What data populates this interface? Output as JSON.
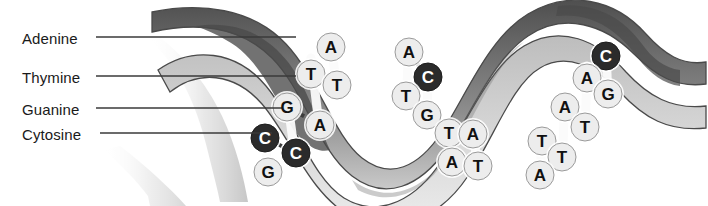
{
  "figure": {
    "width": 708,
    "height": 206,
    "background_color": "#ffffff"
  },
  "colors": {
    "label_text": "#1a1a1a",
    "leader_line": "#3a3a3a",
    "ribbon_outline": "#4a4a4a",
    "ribbon_dark": "#5d5d5d",
    "ribbon_mid": "#a8a8a8",
    "ribbon_light": "#d8d8d8",
    "base_light_fill": "#ededed",
    "base_dark_fill": "#2b2b2b",
    "base_outline": "#9a9a9a",
    "base_letter_light": "#111111",
    "base_letter_dark": "#ffffff",
    "rung_white": "#fbfbfb",
    "bond_dash": "#3c3c3c"
  },
  "legend": {
    "items": [
      {
        "label": "Adenine",
        "x": 22,
        "y": 30,
        "line_y": 37,
        "line_x1": 96,
        "line_x2": 296
      },
      {
        "label": "Thymine",
        "x": 22,
        "y": 69,
        "line_y": 76,
        "line_x1": 96,
        "line_x2": 296
      },
      {
        "label": "Guanine",
        "x": 22,
        "y": 101,
        "line_y": 108,
        "line_x1": 96,
        "line_x2": 283
      },
      {
        "label": "Cytosine",
        "x": 22,
        "y": 126,
        "line_y": 133,
        "line_x1": 100,
        "line_x2": 272
      }
    ]
  },
  "bases": [
    {
      "letter": "A",
      "x": 331,
      "y": 47,
      "shade": "light",
      "r": 14,
      "strand": "left-turn-1"
    },
    {
      "letter": "T",
      "x": 311,
      "y": 74,
      "shade": "light",
      "r": 14,
      "strand": "left-turn-1"
    },
    {
      "letter": "T",
      "x": 337,
      "y": 85,
      "shade": "light",
      "r": 14,
      "strand": "left-turn-1"
    },
    {
      "letter": "G",
      "x": 287,
      "y": 107,
      "shade": "light",
      "r": 14,
      "strand": "left-turn-1"
    },
    {
      "letter": "A",
      "x": 320,
      "y": 125,
      "shade": "light",
      "r": 14,
      "strand": "left-turn-1"
    },
    {
      "letter": "C",
      "x": 265,
      "y": 138,
      "shade": "dark",
      "r": 14,
      "strand": "left-turn-1"
    },
    {
      "letter": "C",
      "x": 296,
      "y": 153,
      "shade": "dark",
      "r": 14,
      "strand": "left-turn-1"
    },
    {
      "letter": "G",
      "x": 268,
      "y": 172,
      "shade": "light",
      "r": 14,
      "strand": "left-turn-1"
    },
    {
      "letter": "A",
      "x": 409,
      "y": 52,
      "shade": "light",
      "r": 14,
      "strand": "mid-turn-2"
    },
    {
      "letter": "C",
      "x": 428,
      "y": 77,
      "shade": "dark",
      "r": 14,
      "strand": "mid-turn-2"
    },
    {
      "letter": "T",
      "x": 406,
      "y": 96,
      "shade": "light",
      "r": 14,
      "strand": "mid-turn-2"
    },
    {
      "letter": "G",
      "x": 427,
      "y": 115,
      "shade": "light",
      "r": 14,
      "strand": "mid-turn-2"
    },
    {
      "letter": "T",
      "x": 449,
      "y": 133,
      "shade": "light",
      "r": 14,
      "strand": "mid-turn-2"
    },
    {
      "letter": "A",
      "x": 473,
      "y": 134,
      "shade": "light",
      "r": 14,
      "strand": "mid-turn-2"
    },
    {
      "letter": "A",
      "x": 452,
      "y": 162,
      "shade": "light",
      "r": 14,
      "strand": "mid-turn-2"
    },
    {
      "letter": "T",
      "x": 478,
      "y": 166,
      "shade": "light",
      "r": 14,
      "strand": "mid-turn-2"
    },
    {
      "letter": "C",
      "x": 606,
      "y": 56,
      "shade": "dark",
      "r": 14,
      "strand": "right-turn-3"
    },
    {
      "letter": "A",
      "x": 587,
      "y": 78,
      "shade": "light",
      "r": 14,
      "strand": "right-turn-3"
    },
    {
      "letter": "G",
      "x": 608,
      "y": 94,
      "shade": "light",
      "r": 14,
      "strand": "right-turn-3"
    },
    {
      "letter": "A",
      "x": 565,
      "y": 107,
      "shade": "light",
      "r": 14,
      "strand": "right-turn-3"
    },
    {
      "letter": "T",
      "x": 585,
      "y": 127,
      "shade": "light",
      "r": 14,
      "strand": "right-turn-3"
    },
    {
      "letter": "T",
      "x": 542,
      "y": 141,
      "shade": "light",
      "r": 14,
      "strand": "right-turn-3"
    },
    {
      "letter": "T",
      "x": 562,
      "y": 157,
      "shade": "light",
      "r": 14,
      "strand": "right-turn-3"
    },
    {
      "letter": "A",
      "x": 540,
      "y": 175,
      "shade": "light",
      "r": 14,
      "strand": "right-turn-3"
    }
  ],
  "rungs": [
    {
      "x1": 331,
      "y1": 40,
      "x2": 337,
      "y2": 92
    },
    {
      "x1": 311,
      "y1": 58,
      "x2": 320,
      "y2": 133
    },
    {
      "x1": 287,
      "y1": 98,
      "x2": 296,
      "y2": 162
    },
    {
      "x1": 265,
      "y1": 128,
      "x2": 268,
      "y2": 180
    },
    {
      "x1": 409,
      "y1": 44,
      "x2": 406,
      "y2": 104
    },
    {
      "x1": 428,
      "y1": 68,
      "x2": 427,
      "y2": 124
    },
    {
      "x1": 449,
      "y1": 124,
      "x2": 452,
      "y2": 172
    },
    {
      "x1": 473,
      "y1": 126,
      "x2": 478,
      "y2": 176
    },
    {
      "x1": 606,
      "y1": 44,
      "x2": 608,
      "y2": 104
    },
    {
      "x1": 587,
      "y1": 66,
      "x2": 585,
      "y2": 137
    },
    {
      "x1": 565,
      "y1": 97,
      "x2": 562,
      "y2": 167
    },
    {
      "x1": 542,
      "y1": 131,
      "x2": 540,
      "y2": 185
    }
  ],
  "bonds": [
    {
      "x1": 269,
      "y1": 140,
      "x2": 292,
      "y2": 151
    },
    {
      "x1": 291,
      "y1": 109,
      "x2": 316,
      "y2": 123
    },
    {
      "x1": 314,
      "y1": 76,
      "x2": 333,
      "y2": 84
    },
    {
      "x1": 412,
      "y1": 54,
      "x2": 424,
      "y2": 75
    },
    {
      "x1": 410,
      "y1": 98,
      "x2": 423,
      "y2": 113
    },
    {
      "x1": 453,
      "y1": 134,
      "x2": 469,
      "y2": 134
    },
    {
      "x1": 456,
      "y1": 163,
      "x2": 474,
      "y2": 165
    },
    {
      "x1": 591,
      "y1": 80,
      "x2": 604,
      "y2": 92
    },
    {
      "x1": 569,
      "y1": 109,
      "x2": 581,
      "y2": 125
    },
    {
      "x1": 546,
      "y1": 143,
      "x2": 558,
      "y2": 155
    }
  ]
}
